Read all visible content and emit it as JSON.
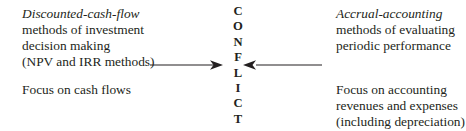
{
  "figure": {
    "background_color": "#ffffff",
    "text_color": "#231f20"
  },
  "left": {
    "top_block": {
      "lines": [
        {
          "text": "Discounted-cash-flow",
          "style": "italic"
        },
        {
          "text": "methods of investment",
          "style": "regular"
        },
        {
          "text": "decision making",
          "style": "regular"
        },
        {
          "text": "(NPV and IRR methods)",
          "style": "regular"
        }
      ]
    },
    "bottom_block": {
      "lines": [
        {
          "text": "Focus on cash flows",
          "style": "regular"
        }
      ]
    }
  },
  "center": {
    "word": "CONFLICT",
    "letters": [
      "C",
      "O",
      "N",
      "F",
      "L",
      "I",
      "C",
      "T"
    ]
  },
  "right": {
    "top_block": {
      "lines": [
        {
          "text": "Accrual-accounting",
          "style": "italic"
        },
        {
          "text": "methods of evaluating",
          "style": "regular"
        },
        {
          "text": "periodic performance",
          "style": "regular"
        }
      ]
    },
    "bottom_block": {
      "lines": [
        {
          "text": "Focus on accounting",
          "style": "regular"
        },
        {
          "text": "revenues and expenses",
          "style": "regular"
        },
        {
          "text": "(including depreciation)",
          "style": "regular"
        }
      ]
    }
  },
  "arrows": [
    {
      "name": "arrow-left-to-center",
      "direction": "right",
      "color": "#231f20"
    },
    {
      "name": "arrow-right-to-center",
      "direction": "left",
      "color": "#231f20"
    }
  ]
}
